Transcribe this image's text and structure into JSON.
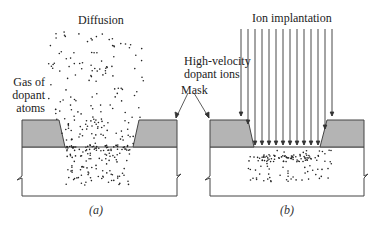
{
  "panels": [
    {
      "id": "a",
      "title": "Diffusion",
      "caption": "(a)",
      "side_label": [
        "Gas of",
        "dopant",
        "atoms"
      ]
    },
    {
      "id": "b",
      "title": "Ion implantation",
      "caption": "(b)",
      "side_label": [
        "High-velocity",
        "dopant ions"
      ]
    }
  ],
  "shared_label": "Mask",
  "colors": {
    "mask": "#b4b4b4",
    "outline": "#333333",
    "dots": "#222222",
    "substrate": "#ffffff"
  }
}
